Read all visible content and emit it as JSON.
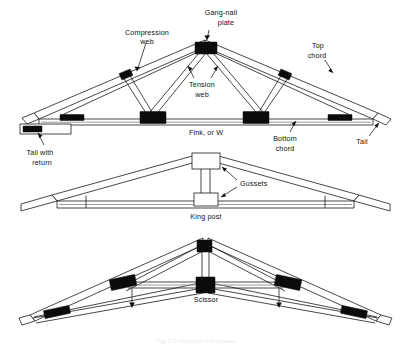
{
  "figure": {
    "caption_faint": "Fig. 7-3  Common roof trusses",
    "background_color": "#ffffff",
    "ink_color": "#111111",
    "plate_color": "#0b0b0b",
    "chord_grey": "#8e8e8e"
  },
  "trusses": [
    {
      "id": "fink",
      "name_label": "Fink, or W",
      "labels": [
        {
          "key": "compression_web",
          "line1": "Compression",
          "line2": "web"
        },
        {
          "key": "gang_nail_plate",
          "line1": "Gang-nail",
          "line2": "plate"
        },
        {
          "key": "top_chord",
          "line1": "Top",
          "line2": "chord"
        },
        {
          "key": "tension_web",
          "line1": "Tension",
          "line2": "web"
        },
        {
          "key": "bottom_chord",
          "line1": "Bottom",
          "line2": "chord"
        },
        {
          "key": "tail_with_return",
          "line1": "Tail with",
          "line2": "return"
        },
        {
          "key": "tail_right",
          "line1": "Tail",
          "line2": ""
        },
        {
          "key": "truss_name",
          "line1": "Fink, or W",
          "line2": ""
        }
      ]
    },
    {
      "id": "king_post",
      "name_label": "King post",
      "labels": [
        {
          "key": "gussets",
          "line1": "Gussets",
          "line2": ""
        },
        {
          "key": "truss_name",
          "line1": "King post",
          "line2": ""
        }
      ]
    },
    {
      "id": "scissor",
      "name_label": "Scissor",
      "labels": [
        {
          "key": "truss_name",
          "line1": "Scissor",
          "line2": ""
        }
      ]
    }
  ],
  "text": {
    "compression_web_l1": "Compression",
    "compression_web_l2": "web",
    "gang_nail_l1": "Gang-nail",
    "gang_nail_l2": "plate",
    "top_chord_l1": "Top",
    "top_chord_l2": "chord",
    "tension_web_l1": "Tension",
    "tension_web_l2": "web",
    "bottom_chord_l1": "Bottom",
    "bottom_chord_l2": "chord",
    "tail_with_return_l1": "Tail with",
    "tail_with_return_l2": "return",
    "tail_right": "Tail",
    "fink_name": "Fink, or W",
    "gussets": "Gussets",
    "king_post_name": "King post",
    "scissor_name": "Scissor",
    "caption": "Fig. 7-3  Common roof trusses"
  }
}
